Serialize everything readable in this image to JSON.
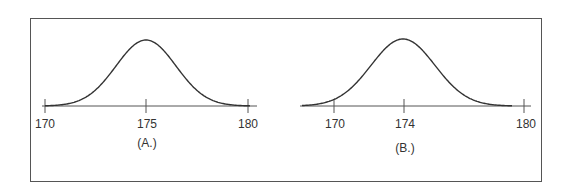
{
  "chart_data": [
    {
      "type": "line",
      "title": "(A.)",
      "description": "Normal distribution curve centered at 175",
      "x_ticks": [
        170,
        175,
        180
      ],
      "mean": 175,
      "xlim": [
        170,
        180
      ],
      "caption": "(A.)"
    },
    {
      "type": "line",
      "title": "(B.)",
      "description": "Normal distribution curve centered at 174",
      "x_ticks": [
        170,
        174,
        180
      ],
      "mean": 174,
      "xlim": [
        168.5,
        180
      ],
      "caption": "(B.)"
    }
  ],
  "labels": {
    "a_tick_0": "170",
    "a_tick_1": "175",
    "a_tick_2": "180",
    "a_caption": "(A.)",
    "b_tick_0": "170",
    "b_tick_1": "174",
    "b_tick_2": "180",
    "b_caption": "(B.)"
  },
  "colors": {
    "line": "#333333",
    "border": "#555555"
  }
}
